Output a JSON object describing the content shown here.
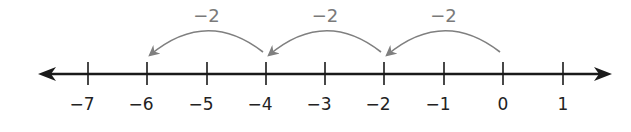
{
  "diagram": {
    "type": "number-line",
    "line_color": "#1a1a1a",
    "arc_color": "#7f7f7f",
    "ticks": [
      {
        "value": -7,
        "label": "−7",
        "x": 88
      },
      {
        "value": -6,
        "label": "−6",
        "x": 147
      },
      {
        "value": -5,
        "label": "−5",
        "x": 207
      },
      {
        "value": -4,
        "label": "−4",
        "x": 266
      },
      {
        "value": -3,
        "label": "−3",
        "x": 325
      },
      {
        "value": -2,
        "label": "−2",
        "x": 384
      },
      {
        "value": -1,
        "label": "−1",
        "x": 444
      },
      {
        "value": 0,
        "label": "0",
        "x": 503
      },
      {
        "value": 1,
        "label": "1",
        "x": 563
      }
    ],
    "jumps": [
      {
        "from": 0,
        "to": -2,
        "label": "−2"
      },
      {
        "from": -2,
        "to": -4,
        "label": "−2"
      },
      {
        "from": -4,
        "to": -6,
        "label": "−2"
      }
    ]
  }
}
